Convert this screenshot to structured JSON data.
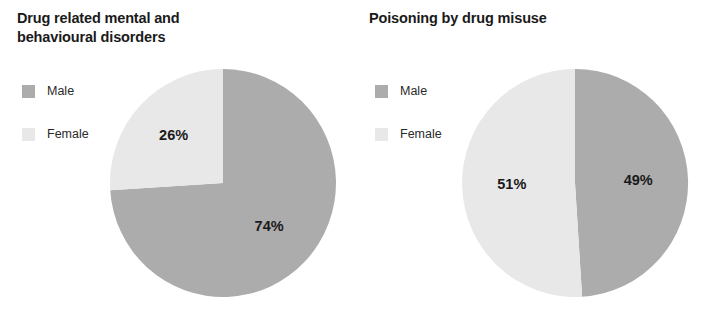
{
  "chart_data": [
    {
      "type": "pie",
      "title": "Drug related mental and\nbehavioural disorders",
      "categories": [
        "Male",
        "Female"
      ],
      "values": [
        74,
        26
      ],
      "value_labels": [
        "74%",
        "26%"
      ],
      "unit": "%",
      "colors": [
        "#acacac",
        "#e8e8e8"
      ],
      "legend_position": "left",
      "start_angle_deg": 0,
      "direction": "clockwise",
      "grid": false,
      "xlabel": "",
      "ylabel": ""
    },
    {
      "type": "pie",
      "title": "Poisoning by drug misuse",
      "categories": [
        "Male",
        "Female"
      ],
      "values": [
        49,
        51
      ],
      "value_labels": [
        "49%",
        "51%"
      ],
      "unit": "%",
      "colors": [
        "#acacac",
        "#e8e8e8"
      ],
      "legend_position": "left",
      "start_angle_deg": 0,
      "direction": "clockwise",
      "grid": false,
      "xlabel": "",
      "ylabel": ""
    }
  ],
  "colors": {
    "male": "#acacac",
    "female": "#e8e8e8",
    "text": "#1a1a1a",
    "legend_text": "#2b2b2b",
    "background": "#ffffff"
  },
  "charts": [
    {
      "title": "Drug related mental and\nbehavioural disorders",
      "legend": [
        {
          "label": "Male",
          "color": "#acacac"
        },
        {
          "label": "Female",
          "color": "#e8e8e8"
        }
      ],
      "slices": [
        {
          "name": "Male",
          "value": 74,
          "label": "74%"
        },
        {
          "name": "Female",
          "value": 26,
          "label": "26%"
        }
      ]
    },
    {
      "title": "Poisoning by drug misuse",
      "legend": [
        {
          "label": "Male",
          "color": "#acacac"
        },
        {
          "label": "Female",
          "color": "#e8e8e8"
        }
      ],
      "slices": [
        {
          "name": "Male",
          "value": 49,
          "label": "49%"
        },
        {
          "name": "Female",
          "value": 51,
          "label": "51%"
        }
      ]
    }
  ]
}
